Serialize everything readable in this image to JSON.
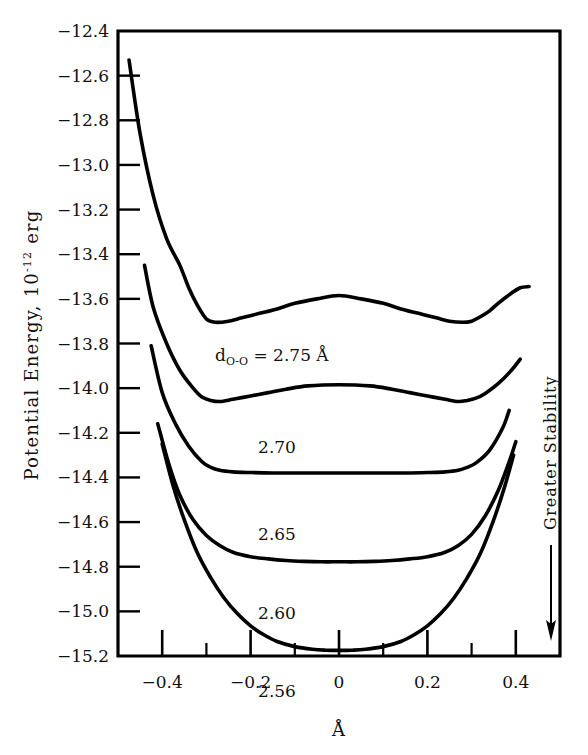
{
  "figure": {
    "background": "#ffffff",
    "ink": "#000000"
  },
  "axes": {
    "y_title_main": "Potential Energy, 10",
    "y_title_exp": "-12",
    "y_title_unit": "erg",
    "x_title": "Å",
    "y_ticks": [
      "-12.4",
      "-12.6",
      "-12.8",
      "-13.0",
      "-13.2",
      "-13.4",
      "-13.6",
      "-13.8",
      "-14.0",
      "-14.2",
      "-14.4",
      "-14.6",
      "-14.8",
      "-15.0",
      "-15.2"
    ],
    "x_ticks": [
      "-0.4",
      "-0.2",
      "0",
      "0.2",
      "0.4"
    ],
    "x_minor_step": 0.1,
    "grid": "off"
  },
  "annotations": {
    "stability_label": "Greater Stability",
    "stability_direction": "down",
    "top_curve_prefix": "d",
    "top_curve_subscript": "O-O",
    "top_curve_equals": " = 2.75 ",
    "top_curve_unit": "Å"
  },
  "chart_data": {
    "type": "line",
    "title": "",
    "subtitle": "",
    "xlabel": "Å",
    "ylabel": "Potential Energy, 10^-12 erg",
    "xlim": [
      -0.5,
      0.5
    ],
    "ylim": [
      -15.2,
      -12.4
    ],
    "grid": false,
    "legend_position": "inline-curve-labels",
    "annotations": [
      {
        "text": "d_O-O = 2.75 Å",
        "x": 0.02,
        "y": -13.46
      },
      {
        "text": "2.70",
        "x": 0.05,
        "y": -13.88
      },
      {
        "text": "2.65",
        "x": 0.05,
        "y": -14.27
      },
      {
        "text": "2.60",
        "x": 0.05,
        "y": -14.62
      },
      {
        "text": "2.56",
        "x": 0.05,
        "y": -14.98
      },
      {
        "text": "Greater Stability",
        "x": 0.52,
        "y": -14.2
      }
    ],
    "series": [
      {
        "name": "2.75",
        "label": "d_O-O = 2.75 Å",
        "well": "double",
        "x": [
          -0.475,
          -0.45,
          -0.42,
          -0.39,
          -0.36,
          -0.34,
          -0.32,
          -0.3,
          -0.28,
          -0.25,
          -0.22,
          -0.18,
          -0.14,
          -0.1,
          -0.05,
          0.0,
          0.05,
          0.1,
          0.14,
          0.18,
          0.22,
          0.25,
          0.28,
          0.3,
          0.32,
          0.34,
          0.36,
          0.39,
          0.41,
          0.43
        ],
        "y": [
          -12.53,
          -12.86,
          -13.14,
          -13.33,
          -13.45,
          -13.55,
          -13.63,
          -13.69,
          -13.705,
          -13.7,
          -13.685,
          -13.665,
          -13.645,
          -13.62,
          -13.6,
          -13.585,
          -13.6,
          -13.62,
          -13.645,
          -13.665,
          -13.685,
          -13.7,
          -13.705,
          -13.7,
          -13.68,
          -13.655,
          -13.62,
          -13.575,
          -13.55,
          -13.545
        ]
      },
      {
        "name": "2.70",
        "well": "double",
        "x": [
          -0.44,
          -0.42,
          -0.39,
          -0.36,
          -0.33,
          -0.31,
          -0.29,
          -0.27,
          -0.24,
          -0.2,
          -0.16,
          -0.12,
          -0.07,
          0.0,
          0.07,
          0.12,
          0.16,
          0.2,
          0.24,
          0.27,
          0.29,
          0.31,
          0.33,
          0.36,
          0.39,
          0.41
        ],
        "y": [
          -13.45,
          -13.64,
          -13.8,
          -13.92,
          -14.0,
          -14.04,
          -14.055,
          -14.06,
          -14.05,
          -14.035,
          -14.02,
          -14.005,
          -13.99,
          -13.985,
          -13.99,
          -14.005,
          -14.02,
          -14.035,
          -14.05,
          -14.06,
          -14.055,
          -14.045,
          -14.025,
          -13.98,
          -13.92,
          -13.87
        ]
      },
      {
        "name": "2.65",
        "well": "shallow-flat",
        "x": [
          -0.425,
          -0.4,
          -0.37,
          -0.34,
          -0.31,
          -0.29,
          -0.27,
          -0.24,
          -0.2,
          -0.15,
          -0.1,
          -0.05,
          0.0,
          0.05,
          0.1,
          0.15,
          0.2,
          0.24,
          0.27,
          0.29,
          0.31,
          0.34,
          0.37,
          0.385
        ],
        "y": [
          -13.81,
          -14.02,
          -14.16,
          -14.26,
          -14.33,
          -14.355,
          -14.368,
          -14.375,
          -14.378,
          -14.38,
          -14.38,
          -14.38,
          -14.38,
          -14.38,
          -14.38,
          -14.38,
          -14.378,
          -14.375,
          -14.368,
          -14.355,
          -14.335,
          -14.28,
          -14.18,
          -14.1
        ]
      },
      {
        "name": "2.60",
        "well": "single-broad",
        "x": [
          -0.41,
          -0.385,
          -0.36,
          -0.33,
          -0.3,
          -0.27,
          -0.24,
          -0.2,
          -0.16,
          -0.12,
          -0.08,
          -0.04,
          0.0,
          0.04,
          0.08,
          0.12,
          0.16,
          0.2,
          0.24,
          0.27,
          0.3,
          0.33,
          0.36,
          0.385,
          0.4
        ],
        "y": [
          -14.16,
          -14.34,
          -14.48,
          -14.59,
          -14.66,
          -14.705,
          -14.735,
          -14.755,
          -14.765,
          -14.772,
          -14.776,
          -14.778,
          -14.778,
          -14.778,
          -14.776,
          -14.772,
          -14.765,
          -14.755,
          -14.735,
          -14.705,
          -14.655,
          -14.575,
          -14.46,
          -14.33,
          -14.24
        ]
      },
      {
        "name": "2.56",
        "well": "single-deep",
        "x": [
          -0.4,
          -0.375,
          -0.35,
          -0.32,
          -0.29,
          -0.26,
          -0.23,
          -0.2,
          -0.17,
          -0.14,
          -0.1,
          -0.06,
          -0.03,
          0.0,
          0.03,
          0.06,
          0.1,
          0.14,
          0.17,
          0.2,
          0.23,
          0.26,
          0.29,
          0.32,
          0.35,
          0.375,
          0.395
        ],
        "y": [
          -14.25,
          -14.44,
          -14.59,
          -14.74,
          -14.85,
          -14.94,
          -15.01,
          -15.065,
          -15.105,
          -15.135,
          -15.158,
          -15.17,
          -15.174,
          -15.175,
          -15.174,
          -15.17,
          -15.158,
          -15.135,
          -15.105,
          -15.065,
          -15.01,
          -14.94,
          -14.85,
          -14.74,
          -14.59,
          -14.44,
          -14.3
        ]
      }
    ]
  }
}
